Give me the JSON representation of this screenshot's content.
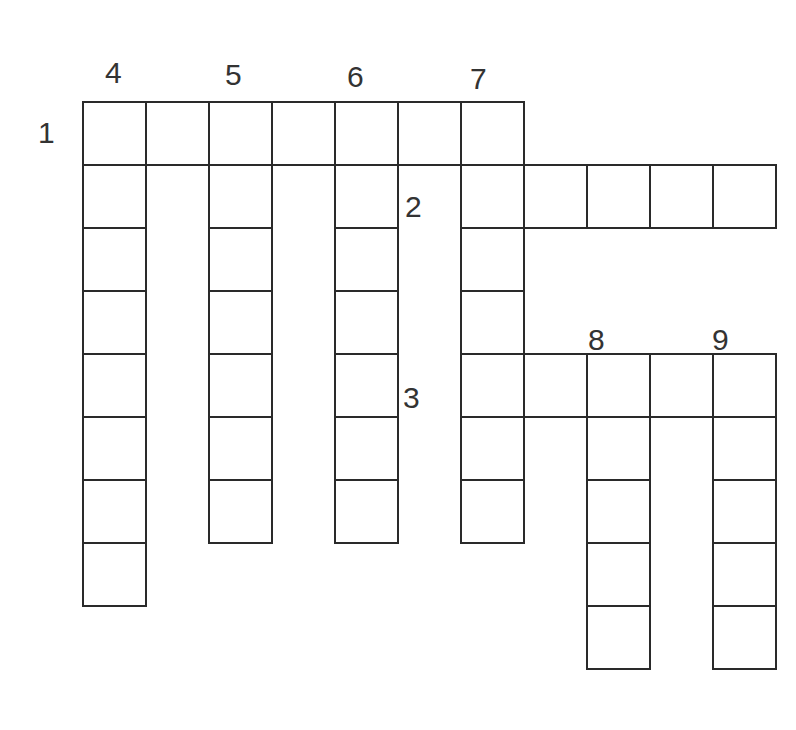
{
  "puzzle": {
    "type": "crossword",
    "cell_size": 63,
    "origin": {
      "x": 82,
      "y": 101
    },
    "line_color": "#2a2a2a",
    "words": [
      {
        "number": "1",
        "direction": "across",
        "row": 0,
        "col": 0,
        "length": 7
      },
      {
        "number": "2",
        "direction": "across",
        "row": 1,
        "col": 6,
        "length": 5
      },
      {
        "number": "3",
        "direction": "across",
        "row": 4,
        "col": 6,
        "length": 5
      },
      {
        "number": "4",
        "direction": "down",
        "row": 0,
        "col": 0,
        "length": 8
      },
      {
        "number": "5",
        "direction": "down",
        "row": 0,
        "col": 2,
        "length": 7
      },
      {
        "number": "6",
        "direction": "down",
        "row": 0,
        "col": 4,
        "length": 7
      },
      {
        "number": "7",
        "direction": "down",
        "row": 0,
        "col": 6,
        "length": 7
      },
      {
        "number": "8",
        "direction": "down",
        "row": 4,
        "col": 8,
        "length": 5
      },
      {
        "number": "9",
        "direction": "down",
        "row": 4,
        "col": 10,
        "length": 5
      }
    ],
    "labels": [
      {
        "text": "1",
        "x": 38,
        "y": 118
      },
      {
        "text": "2",
        "x": 405,
        "y": 192
      },
      {
        "text": "3",
        "x": 403,
        "y": 383
      },
      {
        "text": "4",
        "x": 105,
        "y": 58
      },
      {
        "text": "5",
        "x": 225,
        "y": 60
      },
      {
        "text": "6",
        "x": 347,
        "y": 62
      },
      {
        "text": "7",
        "x": 470,
        "y": 64
      },
      {
        "text": "8",
        "x": 588,
        "y": 325
      },
      {
        "text": "9",
        "x": 712,
        "y": 325
      }
    ]
  }
}
